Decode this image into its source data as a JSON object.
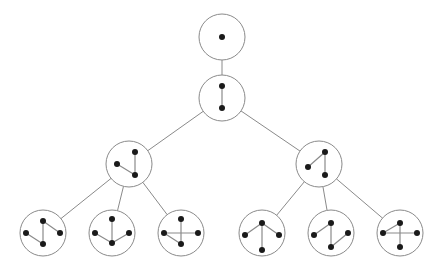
{
  "diagram": {
    "type": "tree-of-graphs",
    "colors": {
      "background": "#ffffff",
      "outline": "#8a8a8a",
      "vertex": "#1a1a1a"
    },
    "node_radius": 23,
    "vertex_radius": 3,
    "nodes": [
      {
        "id": "n1",
        "cx": 222,
        "cy": 37,
        "parent": null,
        "vertices": [
          [
            0,
            0
          ]
        ],
        "edges": []
      },
      {
        "id": "n2",
        "cx": 222,
        "cy": 98,
        "parent": "n1",
        "vertices": [
          [
            0,
            -12
          ],
          [
            0,
            10
          ]
        ],
        "edges": [
          [
            0,
            1
          ]
        ]
      },
      {
        "id": "n3",
        "cx": 129,
        "cy": 164,
        "parent": "n2",
        "vertices": [
          [
            -12,
            0
          ],
          [
            6,
            -12
          ],
          [
            6,
            11
          ]
        ],
        "edges": [
          [
            1,
            2
          ],
          [
            0,
            2
          ]
        ]
      },
      {
        "id": "n4",
        "cx": 319,
        "cy": 164,
        "parent": "n2",
        "vertices": [
          [
            -11,
            3
          ],
          [
            6,
            -12
          ],
          [
            6,
            11
          ]
        ],
        "edges": [
          [
            0,
            1
          ],
          [
            1,
            2
          ]
        ]
      },
      {
        "id": "n5",
        "cx": 43,
        "cy": 233,
        "parent": "n3",
        "vertices": [
          [
            -17,
            0
          ],
          [
            0,
            -12
          ],
          [
            17,
            0
          ],
          [
            0,
            11
          ]
        ],
        "edges": [
          [
            1,
            3
          ],
          [
            0,
            3
          ],
          [
            1,
            2
          ]
        ]
      },
      {
        "id": "n6",
        "cx": 112,
        "cy": 233,
        "parent": "n3",
        "vertices": [
          [
            -17,
            0
          ],
          [
            0,
            -14
          ],
          [
            17,
            0
          ],
          [
            0,
            10
          ]
        ],
        "edges": [
          [
            1,
            3
          ],
          [
            0,
            3
          ],
          [
            2,
            3
          ]
        ]
      },
      {
        "id": "n7",
        "cx": 181,
        "cy": 233,
        "parent": "n3",
        "vertices": [
          [
            -17,
            0
          ],
          [
            0,
            -14
          ],
          [
            17,
            0
          ],
          [
            0,
            11
          ]
        ],
        "edges": [
          [
            1,
            3
          ],
          [
            0,
            3
          ],
          [
            0,
            2
          ]
        ]
      },
      {
        "id": "n8",
        "cx": 262,
        "cy": 233,
        "parent": "n4",
        "vertices": [
          [
            -17,
            2
          ],
          [
            0,
            -10
          ],
          [
            17,
            2
          ],
          [
            0,
            17
          ]
        ],
        "edges": [
          [
            0,
            1
          ],
          [
            1,
            2
          ],
          [
            1,
            3
          ]
        ]
      },
      {
        "id": "n9",
        "cx": 331,
        "cy": 233,
        "parent": "n4",
        "vertices": [
          [
            -17,
            2
          ],
          [
            0,
            -10
          ],
          [
            17,
            0
          ],
          [
            0,
            14
          ]
        ],
        "edges": [
          [
            0,
            1
          ],
          [
            1,
            3
          ],
          [
            3,
            2
          ]
        ]
      },
      {
        "id": "n10",
        "cx": 400,
        "cy": 233,
        "parent": "n4",
        "vertices": [
          [
            -17,
            0
          ],
          [
            0,
            -10
          ],
          [
            17,
            0
          ],
          [
            0,
            14
          ]
        ],
        "edges": [
          [
            0,
            1
          ],
          [
            1,
            3
          ],
          [
            0,
            2
          ]
        ]
      }
    ]
  }
}
